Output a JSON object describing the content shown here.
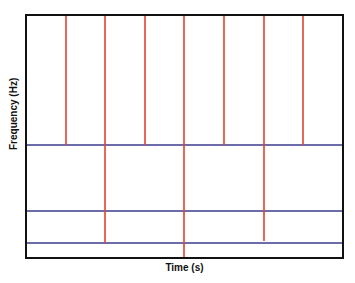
{
  "chart_data": {
    "type": "diagram",
    "title": "",
    "xlabel": "Time (s)",
    "ylabel": "Frequency (Hz)",
    "plot_box": {
      "left": 26,
      "top": 15,
      "right": 343,
      "bottom": 258
    },
    "colors": {
      "vertical": "#e0442e",
      "horizontal": "#3b3b8f",
      "frame": "#111111"
    },
    "horizontal_lines": [
      {
        "y": 145
      },
      {
        "y": 211
      },
      {
        "y": 243
      }
    ],
    "vertical_lines": [
      {
        "x": 66,
        "y_top": 15,
        "y_bottom": 145
      },
      {
        "x": 105,
        "y_top": 15,
        "y_bottom": 243
      },
      {
        "x": 145,
        "y_top": 15,
        "y_bottom": 145
      },
      {
        "x": 184,
        "y_top": 15,
        "y_bottom": 258
      },
      {
        "x": 224,
        "y_top": 15,
        "y_bottom": 145
      },
      {
        "x": 264,
        "y_top": 15,
        "y_bottom": 241
      },
      {
        "x": 303,
        "y_top": 15,
        "y_bottom": 145
      }
    ]
  },
  "labels": {
    "x_axis": "Time (s)",
    "y_axis": "Frequency (Hz)"
  }
}
